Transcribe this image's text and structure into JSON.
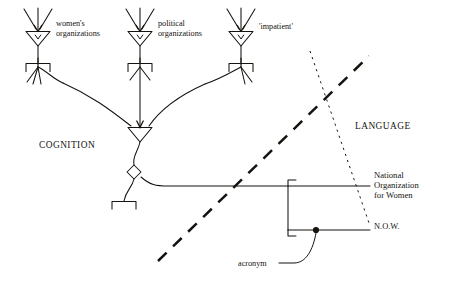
{
  "figure": {
    "background_color": "#ffffff",
    "ink_color": "#16130f"
  },
  "neurons": [
    {
      "id": "womens-organizations",
      "label": "women's\norganizations",
      "x": 38,
      "y": 30
    },
    {
      "id": "political-organizations",
      "label": "political\norganizations",
      "x": 140,
      "y": 30
    },
    {
      "id": "impatient",
      "label": "'impatient'",
      "x": 241,
      "y": 30
    }
  ],
  "domains": [
    {
      "id": "cognition",
      "label": "COGNITION"
    },
    {
      "id": "language",
      "label": "LANGUAGE"
    }
  ],
  "lexical": {
    "full_form": "National\nOrganization\nfor Women",
    "acronym": "N.O.W."
  },
  "annotations": [
    {
      "id": "acronym-annot",
      "label": "acronym"
    }
  ],
  "boundaries": [
    {
      "id": "dashed-boundary",
      "style": "long-dash",
      "thickness": 2.6
    },
    {
      "id": "dotted-boundary",
      "style": "dotted",
      "thickness": 1.0
    }
  ]
}
